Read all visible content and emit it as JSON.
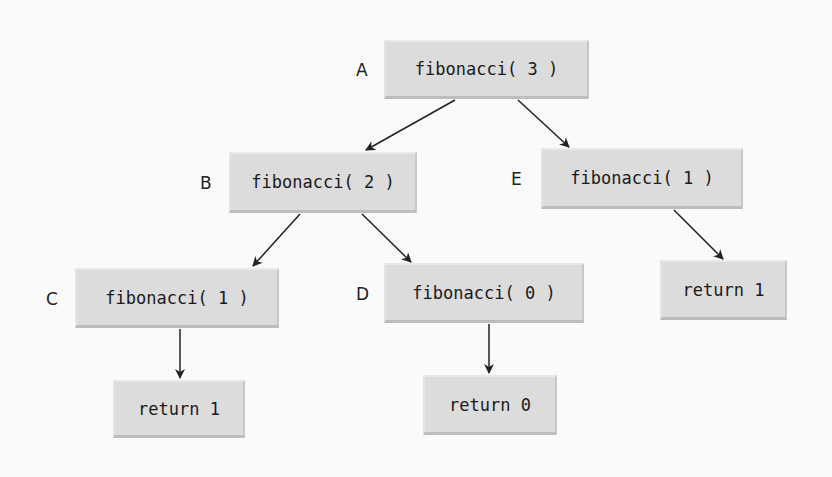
{
  "diagram": {
    "nodes": [
      {
        "id": "A",
        "label": "A",
        "text": "fibonacci( 3 )",
        "x": 384,
        "y": 40,
        "w": 205,
        "h": 59,
        "lx": 356,
        "ly": 60
      },
      {
        "id": "B",
        "label": "B",
        "text": "fibonacci( 2 )",
        "x": 229,
        "y": 152,
        "w": 188,
        "h": 61,
        "lx": 200,
        "ly": 173
      },
      {
        "id": "E",
        "label": "E",
        "text": "fibonacci( 1 )",
        "x": 541,
        "y": 148,
        "w": 202,
        "h": 61,
        "lx": 511,
        "ly": 169
      },
      {
        "id": "C",
        "label": "C",
        "text": "fibonacci( 1 )",
        "x": 75,
        "y": 268,
        "w": 204,
        "h": 60,
        "lx": 46,
        "ly": 289
      },
      {
        "id": "D",
        "label": "D",
        "text": "fibonacci( 0 )",
        "x": 384,
        "y": 263,
        "w": 200,
        "h": 60,
        "lx": 356,
        "ly": 284
      },
      {
        "id": "R1",
        "label": "",
        "text": "return 1",
        "x": 660,
        "y": 260,
        "w": 127,
        "h": 60
      },
      {
        "id": "R2",
        "label": "",
        "text": "return 1",
        "x": 113,
        "y": 380,
        "w": 132,
        "h": 58
      },
      {
        "id": "R3",
        "label": "",
        "text": "return 0",
        "x": 423,
        "y": 375,
        "w": 134,
        "h": 60
      }
    ],
    "edges": [
      {
        "from": "A",
        "to": "B",
        "x1": 455,
        "y1": 100,
        "x2": 366,
        "y2": 150
      },
      {
        "from": "A",
        "to": "E",
        "x1": 518,
        "y1": 100,
        "x2": 569,
        "y2": 147
      },
      {
        "from": "B",
        "to": "C",
        "x1": 300,
        "y1": 214,
        "x2": 253,
        "y2": 266
      },
      {
        "from": "B",
        "to": "D",
        "x1": 362,
        "y1": 214,
        "x2": 411,
        "y2": 262
      },
      {
        "from": "E",
        "to": "R1",
        "x1": 674,
        "y1": 210,
        "x2": 723,
        "y2": 259
      },
      {
        "from": "C",
        "to": "R2",
        "x1": 180,
        "y1": 329,
        "x2": 180,
        "y2": 378
      },
      {
        "from": "D",
        "to": "R3",
        "x1": 489,
        "y1": 324,
        "x2": 489,
        "y2": 373
      }
    ],
    "colors": {
      "box": "#dcdcdc",
      "text": "#1a1a1a",
      "arrow": "#222222",
      "background": "#fafafa"
    }
  }
}
